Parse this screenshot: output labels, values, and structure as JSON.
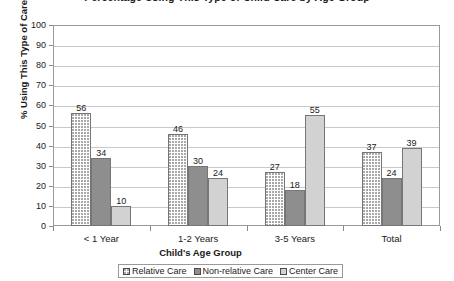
{
  "chart_data": {
    "type": "bar",
    "title": "Percentage Using This Type of Child Care by Age Group",
    "xlabel": "Child's Age Group",
    "ylabel": "% Using This Type of Care",
    "categories": [
      "< 1 Year",
      "1-2 Years",
      "3-5 Years",
      "Total"
    ],
    "series": [
      {
        "name": "Relative Care",
        "values": [
          56,
          46,
          27,
          37
        ],
        "swatch": "#ffffff"
      },
      {
        "name": "Non-relative Care",
        "values": [
          34,
          30,
          18,
          24
        ],
        "swatch": "#8e8e8e"
      },
      {
        "name": "Center Care",
        "values": [
          10,
          24,
          55,
          39
        ],
        "swatch": "#d2d2d2"
      }
    ],
    "ylim": [
      0,
      100
    ],
    "yticks": [
      100,
      90,
      80,
      70,
      60,
      50,
      40,
      30,
      20,
      10,
      0
    ],
    "grid": true,
    "legend_position": "bottom",
    "show_value_labels": true
  }
}
